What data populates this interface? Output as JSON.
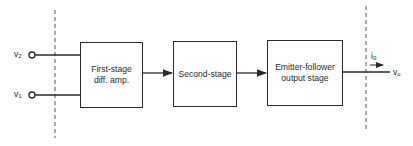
{
  "diagram": {
    "inputs": [
      {
        "id": "v2",
        "symbol": "v",
        "subscript": "2"
      },
      {
        "id": "v1",
        "symbol": "v",
        "subscript": "1"
      }
    ],
    "blocks": [
      {
        "id": "first-stage",
        "lines": [
          "First-stage",
          "diff. amp."
        ]
      },
      {
        "id": "second-stage",
        "lines": [
          "Second-stage"
        ]
      },
      {
        "id": "output-stage",
        "lines": [
          "Emitter-follower",
          "output stage"
        ]
      }
    ],
    "output": {
      "current": {
        "symbol": "i",
        "subscript": "0"
      },
      "voltage": {
        "symbol": "v",
        "subscript": "o"
      }
    },
    "connections": [
      {
        "from": "v2",
        "to": "first-stage"
      },
      {
        "from": "v1",
        "to": "first-stage"
      },
      {
        "from": "first-stage",
        "to": "second-stage"
      },
      {
        "from": "second-stage",
        "to": "output-stage"
      },
      {
        "from": "output-stage",
        "to": "vo"
      }
    ],
    "boundaries": [
      "input-boundary",
      "output-boundary"
    ],
    "colors": {
      "stroke": "#2a2a2a",
      "background": "#ffffff"
    }
  }
}
